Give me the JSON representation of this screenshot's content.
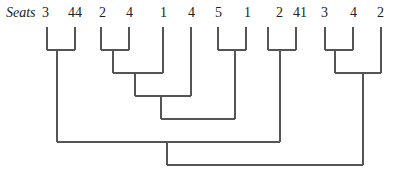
{
  "diagram": {
    "title": "Seats",
    "type": "dendrogram",
    "leaves": [
      {
        "label": "3",
        "x": 47
      },
      {
        "label": "44",
        "x": 75
      },
      {
        "label": "2",
        "x": 101
      },
      {
        "label": "4",
        "x": 129
      },
      {
        "label": "1",
        "x": 163
      },
      {
        "label": "4",
        "x": 191
      },
      {
        "label": "5",
        "x": 218
      },
      {
        "label": "1",
        "x": 246
      },
      {
        "label": "2",
        "x": 268
      },
      {
        "label": "41",
        "x": 296
      },
      {
        "label": "3",
        "x": 325
      },
      {
        "label": "4",
        "x": 353
      },
      {
        "label": "2",
        "x": 381
      }
    ],
    "merges": [
      {
        "left": "leaf 3",
        "right": "leaf 44",
        "level": 50
      },
      {
        "left": "leaf 2",
        "right": "leaf 4",
        "level": 50
      },
      {
        "left": "leaf 5",
        "right": "leaf 1",
        "level": 50
      },
      {
        "left": "leaf 2",
        "right": "leaf 41",
        "level": 50
      },
      {
        "left": "leaf 3",
        "right": "leaf 4",
        "level": 50
      },
      {
        "left": "(2,4)",
        "right": "leaf 1",
        "level": 73
      },
      {
        "left": "(3,4)",
        "right": "leaf 2",
        "level": 73
      },
      {
        "left": "((2,4),1)",
        "right": "leaf 4",
        "level": 96
      },
      {
        "left": "(((2,4),1),4)",
        "right": "(5,1)",
        "level": 119
      },
      {
        "left": "(3,44)",
        "right": "(2,41)",
        "level": 142
      },
      {
        "left": "left cluster",
        "right": "right cluster",
        "level": 165
      }
    ],
    "line_color": "#555555"
  }
}
